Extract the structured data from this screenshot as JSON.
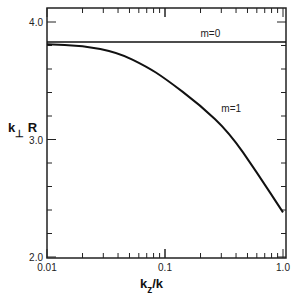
{
  "chart_data": {
    "type": "line",
    "title": "",
    "xlabel": "k_z/k",
    "xlabel_main": "k",
    "xlabel_sub": "z",
    "xlabel_rest": "/k",
    "ylabel": "k_⊥R",
    "ylabel_main": "k",
    "ylabel_sub": "⊥",
    "ylabel_rest": " R",
    "xscale": "log",
    "xlim": [
      0.01,
      1.0
    ],
    "ylim": [
      2.0,
      4.1
    ],
    "x_ticks": [
      {
        "value": 0.01,
        "label": "0.01"
      },
      {
        "value": 0.1,
        "label": "0.1"
      },
      {
        "value": 1.0,
        "label": "1.0"
      }
    ],
    "y_ticks": [
      {
        "value": 2.0,
        "label": "2.0"
      },
      {
        "value": 3.0,
        "label": "3.0"
      },
      {
        "value": 4.0,
        "label": "4.0"
      }
    ],
    "y_minor_step": 0.2,
    "grid": false,
    "legend": null,
    "series": [
      {
        "name": "m=0",
        "label": "m=0",
        "x": [
          0.01,
          1.0
        ],
        "y": [
          3.83,
          3.83
        ]
      },
      {
        "name": "m=1",
        "label": "m=1",
        "x": [
          0.01,
          0.02,
          0.04,
          0.07,
          0.1,
          0.2,
          0.35,
          0.6,
          1.0
        ],
        "y": [
          3.81,
          3.8,
          3.74,
          3.62,
          3.52,
          3.29,
          3.06,
          2.72,
          2.38
        ]
      }
    ],
    "annotations": [
      {
        "text": "m=0",
        "x": 0.2,
        "y": 3.87
      },
      {
        "text": "m=1",
        "x": 0.3,
        "y": 3.23
      }
    ]
  }
}
